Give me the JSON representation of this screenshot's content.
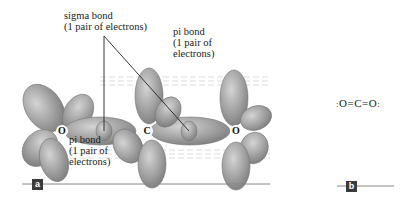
{
  "figure": {
    "panel_a": {
      "tag": "a",
      "atoms": [
        {
          "symbol": "O",
          "x": 62,
          "y": 131
        },
        {
          "symbol": "C",
          "x": 147,
          "y": 131
        },
        {
          "symbol": "O",
          "x": 236,
          "y": 131
        }
      ],
      "labels": {
        "sigma_bond": {
          "line1": "sigma bond",
          "line2": "(1 pair of electrons)"
        },
        "pi_bond_top": {
          "line1": "pi bond",
          "line2": "(1 pair of",
          "line3": "electrons)"
        },
        "pi_bond_bottom": {
          "line1": "pi bond",
          "line2": "(1 pair of",
          "line3": "electrons)"
        }
      }
    },
    "panel_b": {
      "tag": "b",
      "lewis_structure": ":O=C=O:",
      "lewis_parts": {
        "o_left": "O",
        "bond1": "=",
        "c": "C",
        "bond2": "=",
        "o_right": "O"
      }
    },
    "colors": {
      "orbital_fill": "#9a9a9a",
      "orbital_highlight": "#c8c8c8",
      "text": "#222222",
      "tag_bg": "#3a3a3a",
      "rule": "#888888"
    }
  }
}
